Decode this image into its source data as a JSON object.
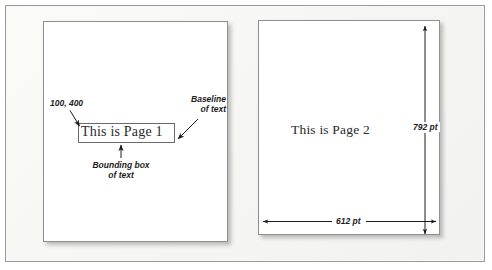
{
  "figure": {
    "background_color": "#f7f7f6",
    "frame_color": "#9a9a9a"
  },
  "pages": [
    {
      "id": "page-one",
      "text": "This is Page 1",
      "has_bounding_box": true,
      "annotations": [
        {
          "name": "coordinates",
          "text": "100, 400",
          "points_to": "text-origin"
        },
        {
          "name": "baseline",
          "line1": "Baseline",
          "line2": "of text",
          "points_to": "text-baseline"
        },
        {
          "name": "bounding-box",
          "line1": "Bounding box",
          "line2": "of text",
          "points_to": "bounding-box-bottom"
        }
      ]
    },
    {
      "id": "page-two",
      "text": "This is Page 2",
      "has_bounding_box": false,
      "dimensions": {
        "height_label": "792 pt",
        "width_label": "612 pt"
      }
    }
  ],
  "colors": {
    "page_fill": "#ffffff",
    "page_border": "#8f8f8f",
    "text": "#2b2b2b",
    "annotation_text": "#1c1c1c",
    "arrow": "#1c1c1c"
  }
}
